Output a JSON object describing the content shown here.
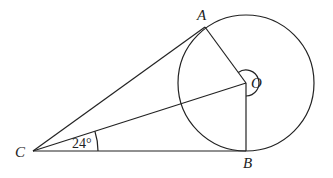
{
  "diagram": {
    "points": {
      "A": {
        "label": "A",
        "x": 205,
        "y": 27
      },
      "O": {
        "label": "O",
        "x": 246,
        "y": 83
      },
      "B": {
        "label": "B",
        "x": 246,
        "y": 151
      },
      "C": {
        "label": "C",
        "x": 33,
        "y": 151
      }
    },
    "circle": {
      "center": "O",
      "radius": 68
    },
    "segments": [
      "CA",
      "CO",
      "CB",
      "OA",
      "OB"
    ],
    "angle_marks": [
      {
        "vertex": "C",
        "between": [
          "CO",
          "CB"
        ],
        "label": "24°"
      },
      {
        "vertex": "O",
        "between": [
          "OA",
          "OB"
        ],
        "type": "reflex",
        "label": ""
      }
    ],
    "stroke_color": "#222222"
  }
}
